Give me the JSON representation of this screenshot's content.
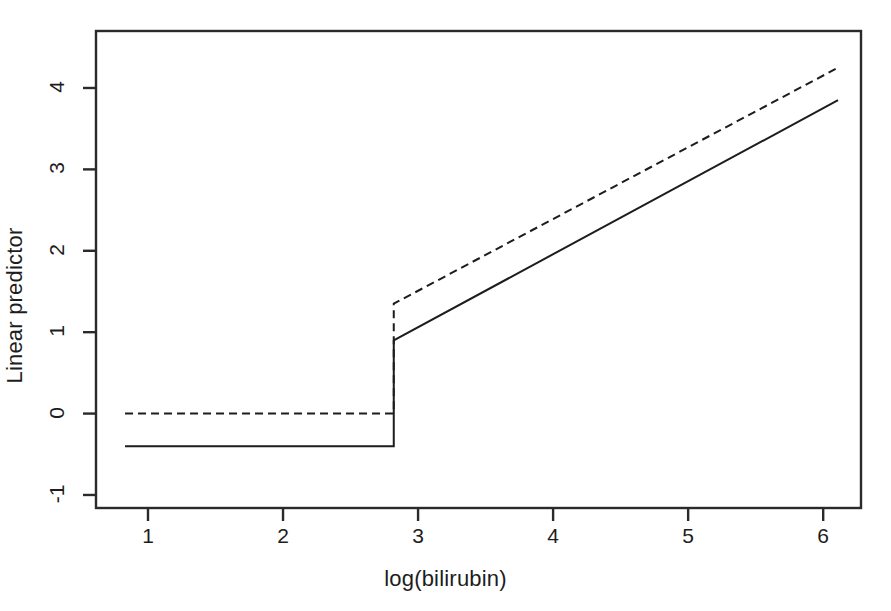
{
  "chart_data": {
    "type": "line",
    "title": "",
    "xlabel": "log(bilirubin)",
    "ylabel": "Linear predictor",
    "xlim": [
      0.615,
      6.28
    ],
    "ylim": [
      -1.16,
      4.7
    ],
    "xticks": [
      1,
      2,
      3,
      4,
      5,
      6
    ],
    "xtick_labels": [
      "1",
      "2",
      "3",
      "4",
      "5",
      "6"
    ],
    "yticks": [
      -1,
      0,
      1,
      2,
      3,
      4
    ],
    "ytick_labels": [
      "-1",
      "0",
      "1",
      "2",
      "3",
      "4"
    ],
    "grid": false,
    "legend": "none",
    "box": true,
    "series": [
      {
        "name": "solid",
        "style": "solid",
        "color": "#1d1d1d",
        "width": 2,
        "description": "step function: flat at -0.40 then jumps at log(bilirubin)=2.82 and rises linearly to 3.85",
        "x": [
          0.83,
          2.82,
          2.82,
          6.11
        ],
        "y": [
          -0.4,
          -0.4,
          0.9,
          3.85
        ],
        "breakpoint_x": 2.82,
        "left_level": -0.4,
        "jump_to": 0.9,
        "right_end": 3.85,
        "right_slope": 0.9
      },
      {
        "name": "dashed",
        "style": "dashed",
        "color": "#1d1d1d",
        "width": 2,
        "description": "step function: flat at 0.00 then jumps at log(bilirubin)=2.82 and rises linearly to 4.25",
        "x": [
          0.83,
          2.82,
          2.82,
          6.11
        ],
        "y": [
          0.0,
          0.0,
          1.35,
          4.25
        ],
        "breakpoint_x": 2.82,
        "left_level": 0.0,
        "jump_to": 1.35,
        "right_end": 4.25,
        "right_slope": 0.88
      }
    ]
  }
}
